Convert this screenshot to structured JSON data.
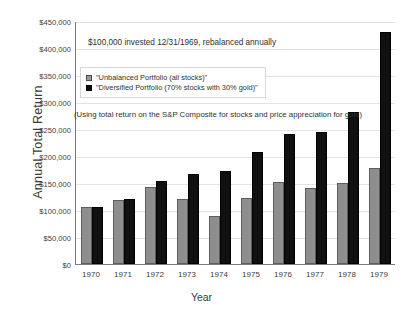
{
  "chart_data": {
    "type": "bar",
    "title": "",
    "xlabel": "Year",
    "ylabel": "Annual Total Return",
    "categories": [
      "1970",
      "1971",
      "1972",
      "1973",
      "1974",
      "1975",
      "1976",
      "1977",
      "1978",
      "1979"
    ],
    "series": [
      {
        "name": "\"Unbalanced Portfolio (all stocks)\"",
        "color": "#8e8e8e",
        "values": [
          105000,
          119000,
          142000,
          121000,
          89000,
          123000,
          151000,
          141000,
          150000,
          178000
        ]
      },
      {
        "name": "\"Diversified Portfolio (70% stocks with 30% gold)\"",
        "color": "#101010",
        "values": [
          105000,
          120000,
          153000,
          167000,
          173000,
          207000,
          240000,
          244000,
          281000,
          430000
        ]
      }
    ],
    "ylim": [
      0,
      450000
    ],
    "ytick_values": [
      0,
      50000,
      100000,
      150000,
      200000,
      250000,
      300000,
      350000,
      400000,
      450000
    ],
    "ytick_labels": [
      "$0",
      "$50,000",
      "$100,000",
      "$150,000",
      "$200,000",
      "$250,000",
      "$300,000",
      "$350,000",
      "$400,000",
      "$450,000"
    ],
    "grid": true,
    "legend_position": "upper-left-inside",
    "annotations": [
      "$100,000 invested 12/31/1969, rebalanced annually",
      "(Using total return on the S&P Composite for stocks and price appreciation for gold)"
    ]
  },
  "axes": {
    "y_title": "Annual Total Return",
    "x_title": "Year"
  },
  "legend": {
    "items": [
      {
        "label": "\"Unbalanced Portfolio (all stocks)\""
      },
      {
        "label": "\"Diversified Portfolio (70% stocks with 30% gold)\""
      }
    ]
  },
  "annotations": {
    "invested": "$100,000 invested 12/31/1969, rebalanced annually",
    "method": "(Using total return on the S&P Composite for stocks and price appreciation for gold)"
  }
}
